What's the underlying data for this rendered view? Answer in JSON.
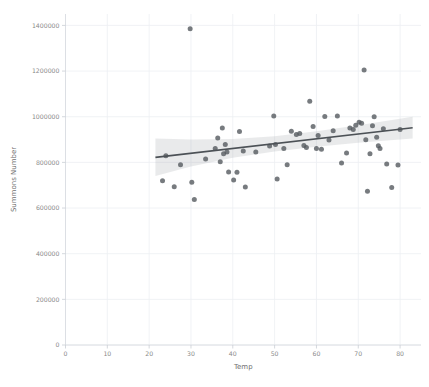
{
  "chart_data": {
    "type": "scatter",
    "title": "",
    "xlabel": "Temp",
    "ylabel": "Summons Number",
    "xlim": [
      0,
      85
    ],
    "ylim": [
      0,
      1450000
    ],
    "grid": true,
    "legend": null,
    "xticks": [
      0,
      10,
      20,
      30,
      40,
      50,
      60,
      70,
      80
    ],
    "xtick_labels": [
      "0",
      "10",
      "20",
      "30",
      "40",
      "50",
      "60",
      "70",
      "80"
    ],
    "yticks": [
      0,
      200000,
      400000,
      600000,
      800000,
      1000000,
      1200000,
      1400000
    ],
    "ytick_labels": [
      "0",
      "200000",
      "400000",
      "600000",
      "800000",
      "1000000",
      "1200000",
      "1400000"
    ],
    "point_color": "#555a5f",
    "line_color": "#4c5156",
    "band_color": "#9aa0a6",
    "grid_color": "#eceff3",
    "background_color": "#ffffff",
    "regression": {
      "x_start": 21.5,
      "x_end": 83.0,
      "y_start": 822000,
      "y_end": 952000
    },
    "confidence_band": {
      "x": [
        21.5,
        30.0,
        40.0,
        50.0,
        60.0,
        70.0,
        83.0
      ],
      "upper": [
        905000,
        900000,
        902000,
        915000,
        936000,
        963000,
        1000000
      ],
      "lower": [
        740000,
        782000,
        820000,
        848000,
        868000,
        886000,
        905000
      ]
    },
    "points": [
      {
        "x": 23.2,
        "y": 719000
      },
      {
        "x": 24.0,
        "y": 829000
      },
      {
        "x": 26.0,
        "y": 693000
      },
      {
        "x": 27.5,
        "y": 790000
      },
      {
        "x": 29.8,
        "y": 1385000
      },
      {
        "x": 30.2,
        "y": 713000
      },
      {
        "x": 30.8,
        "y": 637000
      },
      {
        "x": 33.5,
        "y": 815000
      },
      {
        "x": 35.8,
        "y": 861000
      },
      {
        "x": 36.4,
        "y": 907000
      },
      {
        "x": 37.0,
        "y": 803000
      },
      {
        "x": 37.5,
        "y": 951000
      },
      {
        "x": 37.8,
        "y": 838000
      },
      {
        "x": 38.2,
        "y": 878000
      },
      {
        "x": 38.6,
        "y": 845000
      },
      {
        "x": 39.0,
        "y": 758000
      },
      {
        "x": 40.2,
        "y": 723000
      },
      {
        "x": 41.0,
        "y": 757000
      },
      {
        "x": 41.6,
        "y": 935000
      },
      {
        "x": 42.5,
        "y": 850000
      },
      {
        "x": 43.0,
        "y": 692000
      },
      {
        "x": 45.5,
        "y": 846000
      },
      {
        "x": 48.8,
        "y": 872000
      },
      {
        "x": 49.8,
        "y": 1003000
      },
      {
        "x": 50.2,
        "y": 878000
      },
      {
        "x": 50.6,
        "y": 727000
      },
      {
        "x": 52.2,
        "y": 861000
      },
      {
        "x": 53.0,
        "y": 790000
      },
      {
        "x": 54.0,
        "y": 936000
      },
      {
        "x": 55.2,
        "y": 922000
      },
      {
        "x": 56.0,
        "y": 927000
      },
      {
        "x": 57.0,
        "y": 874000
      },
      {
        "x": 57.6,
        "y": 865000
      },
      {
        "x": 58.4,
        "y": 1068000
      },
      {
        "x": 59.2,
        "y": 957000
      },
      {
        "x": 60.0,
        "y": 861000
      },
      {
        "x": 60.4,
        "y": 918000
      },
      {
        "x": 61.2,
        "y": 857000
      },
      {
        "x": 62.0,
        "y": 1001000
      },
      {
        "x": 63.0,
        "y": 898000
      },
      {
        "x": 64.0,
        "y": 939000
      },
      {
        "x": 65.0,
        "y": 1003000
      },
      {
        "x": 66.0,
        "y": 797000
      },
      {
        "x": 67.2,
        "y": 841000
      },
      {
        "x": 68.0,
        "y": 951000
      },
      {
        "x": 68.8,
        "y": 944000
      },
      {
        "x": 69.4,
        "y": 963000
      },
      {
        "x": 70.2,
        "y": 976000
      },
      {
        "x": 70.8,
        "y": 971000
      },
      {
        "x": 71.4,
        "y": 1205000
      },
      {
        "x": 71.8,
        "y": 899000
      },
      {
        "x": 72.2,
        "y": 674000
      },
      {
        "x": 72.8,
        "y": 838000
      },
      {
        "x": 73.4,
        "y": 960000
      },
      {
        "x": 73.8,
        "y": 1000000
      },
      {
        "x": 74.4,
        "y": 910000
      },
      {
        "x": 74.8,
        "y": 873000
      },
      {
        "x": 75.2,
        "y": 861000
      },
      {
        "x": 76.0,
        "y": 947000
      },
      {
        "x": 76.8,
        "y": 793000
      },
      {
        "x": 78.0,
        "y": 690000
      },
      {
        "x": 79.5,
        "y": 789000
      },
      {
        "x": 80.0,
        "y": 944000
      }
    ]
  },
  "axes": {
    "x_title": "Temp",
    "y_title": "Summons Number"
  }
}
